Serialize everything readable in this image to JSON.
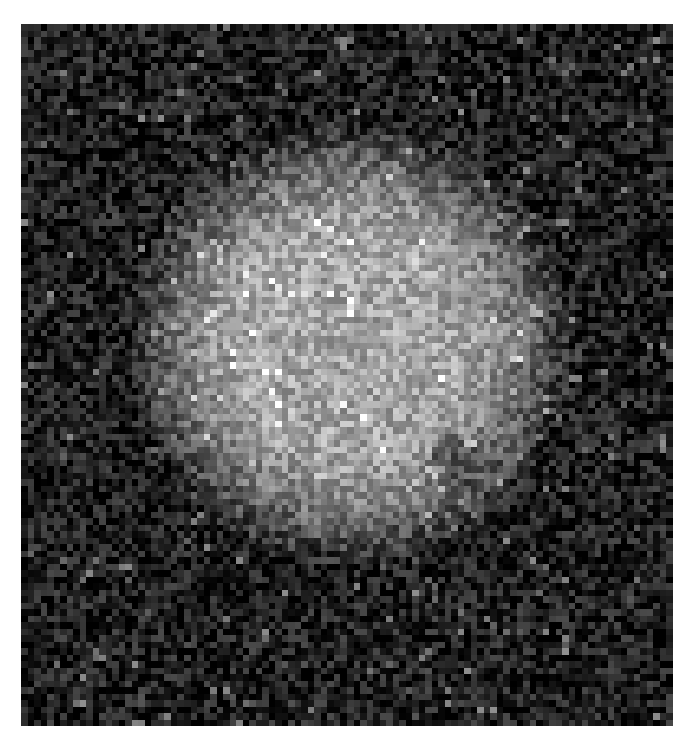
{
  "image": {
    "kind": "grayscale-noisy-micrograph",
    "grid": {
      "cols": 100,
      "rows": 108
    },
    "disc": {
      "cx": 0.5,
      "cy": 0.45,
      "rx": 0.3,
      "ry": 0.3
    },
    "dark_patch": {
      "cx": 0.67,
      "cy": 0.62,
      "w": 0.09,
      "h": 0.06,
      "angle": -35
    },
    "colors": {
      "background": "#0b0b0b",
      "page": "#ffffff"
    }
  }
}
